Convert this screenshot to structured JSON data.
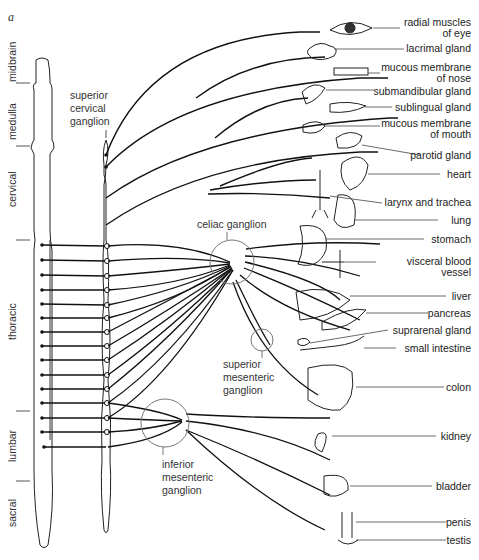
{
  "figure_label": "a",
  "spinal_regions": [
    {
      "name": "midbrain"
    },
    {
      "name": "medulla"
    },
    {
      "name": "cervical"
    },
    {
      "name": "thoracic"
    },
    {
      "name": "lumbar"
    },
    {
      "name": "sacral"
    }
  ],
  "ganglia": {
    "superior_cervical": [
      "superior",
      "cervical",
      "ganglion"
    ],
    "celiac": "celiac  ganglion",
    "superior_mesenteric": [
      "superior",
      "mesenteric",
      "ganglion"
    ],
    "inferior_mesenteric": [
      "inferior",
      "mesenteric",
      "ganglion"
    ]
  },
  "organs": [
    {
      "lines": [
        "radial muscles",
        "of eye"
      ]
    },
    {
      "lines": [
        "lacrimal gland"
      ]
    },
    {
      "lines": [
        "mucous membrane",
        "of nose"
      ]
    },
    {
      "lines": [
        "submandibular gland"
      ]
    },
    {
      "lines": [
        "sublingual gland"
      ]
    },
    {
      "lines": [
        "mucous membrane",
        "of mouth"
      ]
    },
    {
      "lines": [
        "parotid gland"
      ]
    },
    {
      "lines": [
        "heart"
      ]
    },
    {
      "lines": [
        "larynx and trachea"
      ]
    },
    {
      "lines": [
        "lung"
      ]
    },
    {
      "lines": [
        "stomach"
      ]
    },
    {
      "lines": [
        "visceral blood",
        "vessel"
      ]
    },
    {
      "lines": [
        "liver"
      ]
    },
    {
      "lines": [
        "pancreas"
      ]
    },
    {
      "lines": [
        "suprarenal gland"
      ]
    },
    {
      "lines": [
        "small intestine"
      ]
    },
    {
      "lines": [
        "colon"
      ]
    },
    {
      "lines": [
        "kidney"
      ]
    },
    {
      "lines": [
        "bladder"
      ]
    },
    {
      "lines": [
        "penis"
      ]
    },
    {
      "lines": [
        "testis"
      ]
    }
  ],
  "colors": {
    "line": "#111111",
    "thin": "#444444",
    "circle": "#777777"
  }
}
